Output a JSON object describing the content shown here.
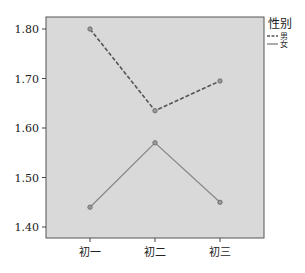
{
  "chart_data": {
    "type": "line",
    "title": "",
    "xlabel": "",
    "ylabel": "",
    "categories": [
      "初一",
      "初二",
      "初三"
    ],
    "series": [
      {
        "name": "男",
        "values": [
          1.8,
          1.635,
          1.695
        ],
        "style": "dashed",
        "color": "#555555"
      },
      {
        "name": "女",
        "values": [
          1.44,
          1.57,
          1.45
        ],
        "style": "solid",
        "color": "#888888"
      }
    ],
    "ylim": [
      1.38,
      1.82
    ],
    "yticks": [
      "1.40",
      "1.50",
      "1.60",
      "1.70",
      "1.80"
    ],
    "grid": false,
    "legend": {
      "title": "性别",
      "position": "right",
      "entries": [
        "男",
        "女"
      ]
    },
    "plot_background": "#d9d9d9"
  }
}
